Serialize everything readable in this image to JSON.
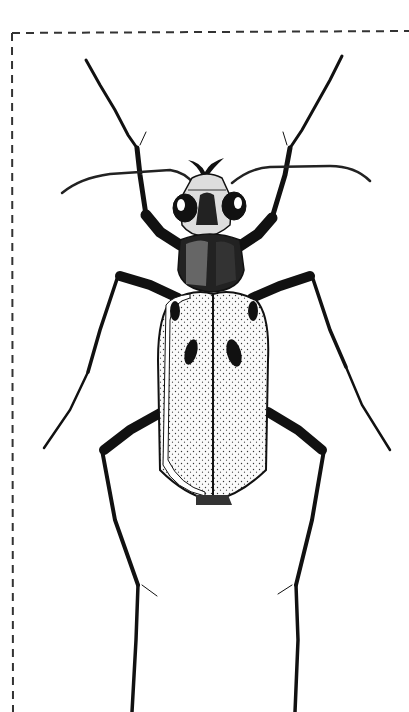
{
  "figure": {
    "style": "black ink stipple drawing",
    "border": "dashed frame on top and left edges",
    "colors": {
      "ink": "#111111",
      "paper": "#ffffff",
      "border": "#333333"
    },
    "parts": {
      "antennae": "antennae",
      "head": "head",
      "eyes": "compound-eyes",
      "mandibles": "mandibles",
      "pronotum": "pronotum",
      "elytra": "elytra",
      "elytral_spots": "elytral-spots",
      "front_legs": "front-legs",
      "middle_legs": "middle-legs",
      "hind_legs": "hind-legs"
    }
  }
}
